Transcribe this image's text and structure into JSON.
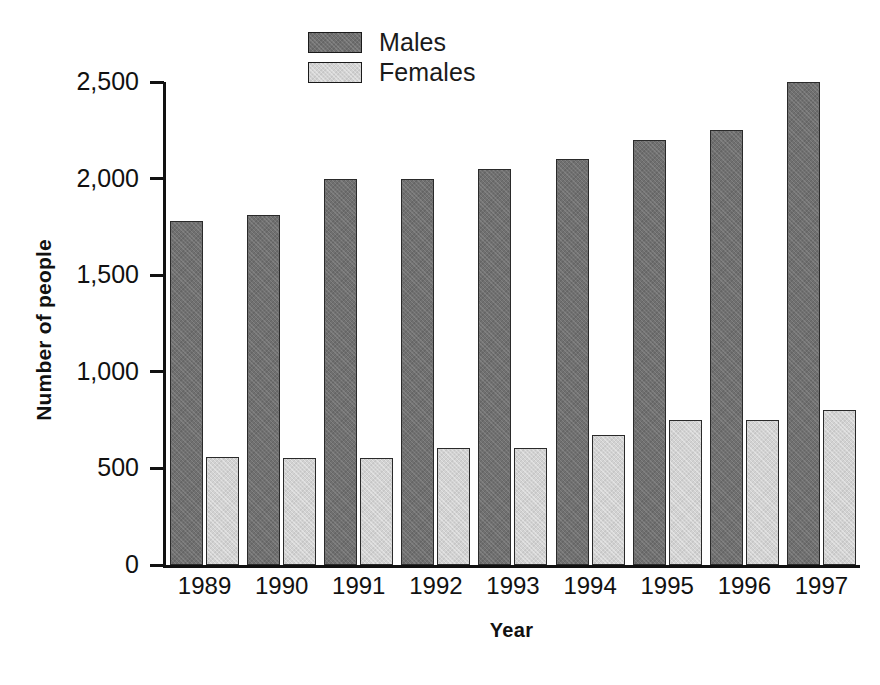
{
  "chart_data": {
    "type": "bar",
    "title": "",
    "xlabel": "Year",
    "ylabel": "Number of people",
    "categories": [
      "1989",
      "1990",
      "1991",
      "1992",
      "1993",
      "1994",
      "1995",
      "1996",
      "1997"
    ],
    "series": [
      {
        "name": "Males",
        "color": "#707070",
        "values": [
          1780,
          1810,
          2000,
          2000,
          2050,
          2100,
          2200,
          2250,
          2500
        ]
      },
      {
        "name": "Females",
        "color": "#d2d2d2",
        "values": [
          560,
          555,
          555,
          605,
          605,
          675,
          750,
          750,
          800
        ]
      }
    ],
    "ylim": [
      0,
      2500
    ],
    "y_ticks": [
      0,
      500,
      1000,
      1500,
      2000,
      2500
    ],
    "y_tick_labels": [
      "0",
      "500",
      "1,000",
      "1,500",
      "2,000",
      "2,500"
    ],
    "grid": false,
    "legend_position": "top-center"
  },
  "legend": {
    "items": [
      {
        "label": "Males",
        "swatch": "males-swatch"
      },
      {
        "label": "Females",
        "swatch": "females-swatch"
      }
    ]
  },
  "axes": {
    "y_title": "Number of people",
    "x_title": "Year"
  },
  "colors": {
    "males": "#707070",
    "females": "#d2d2d2",
    "axis": "#111111",
    "background": "#ffffff"
  }
}
